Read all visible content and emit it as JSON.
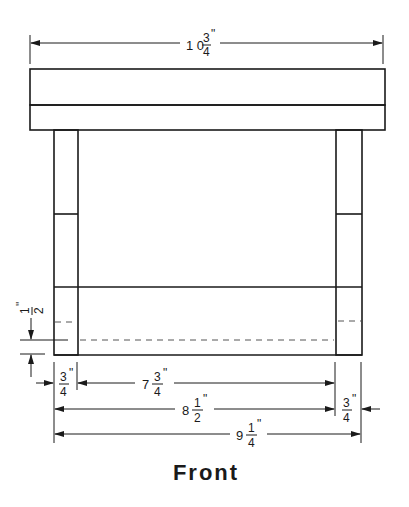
{
  "drawing": {
    "title": "Front",
    "view": "front elevation",
    "colors": {
      "line": "#1a1a1a",
      "background": "#ffffff",
      "hidden_line": "#555555"
    }
  },
  "dimensions": {
    "overall_top": {
      "whole": "1 0",
      "num": "3",
      "den": "4",
      "unit": "\""
    },
    "leg_height_offset": {
      "whole": "",
      "num": "1",
      "den": "2",
      "unit": "\""
    },
    "left_leg_width": {
      "whole": "",
      "num": "3",
      "den": "4",
      "unit": "\""
    },
    "inner_span": {
      "whole": "7",
      "num": "3",
      "den": "4",
      "unit": "\""
    },
    "outer_to_inner": {
      "whole": "8",
      "num": "1",
      "den": "2",
      "unit": "\""
    },
    "right_leg_width": {
      "whole": "",
      "num": "3",
      "den": "4",
      "unit": "\""
    },
    "overall_base": {
      "whole": "9",
      "num": "1",
      "den": "4",
      "unit": "\""
    }
  },
  "parts": [
    {
      "name": "top-board-upper"
    },
    {
      "name": "top-board-lower"
    },
    {
      "name": "left-leg"
    },
    {
      "name": "right-leg"
    },
    {
      "name": "bottom-apron"
    }
  ]
}
